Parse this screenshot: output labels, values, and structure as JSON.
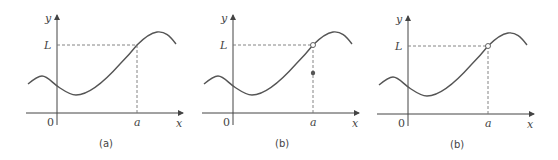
{
  "figure": {
    "panels": [
      {
        "caption": "(a)",
        "y_axis_label": "y",
        "x_axis_label": "x",
        "origin_label": "0",
        "x_tick_label": "a",
        "y_tick_label": "L",
        "marker": "none"
      },
      {
        "caption": "(b)",
        "y_axis_label": "y",
        "x_axis_label": "x",
        "origin_label": "0",
        "x_tick_label": "a",
        "y_tick_label": "L",
        "marker": "open-circle-at-limit-with-filled-point-below"
      },
      {
        "caption": "(b)",
        "y_axis_label": "y",
        "x_axis_label": "x",
        "origin_label": "0",
        "x_tick_label": "a",
        "y_tick_label": "L",
        "marker": "open-circle-at-limit"
      }
    ]
  }
}
